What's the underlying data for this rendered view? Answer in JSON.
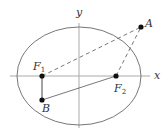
{
  "diagram": {
    "type": "ellipse-foci",
    "colors": {
      "ellipse": "#777777",
      "axis": "#aaaaaa",
      "line": "#555555",
      "point": "#111111",
      "label": "#333333"
    },
    "axes": {
      "x_label": "x",
      "y_label": "y"
    },
    "points": [
      {
        "id": "A",
        "label": "A"
      },
      {
        "id": "F1",
        "label": "F",
        "sub": "1"
      },
      {
        "id": "F2",
        "label": "F",
        "sub": "2"
      },
      {
        "id": "B",
        "label": "B"
      }
    ],
    "segments": [
      {
        "from": "F1",
        "to": "A",
        "style": "dashed"
      },
      {
        "from": "F2",
        "to": "A",
        "style": "dashed"
      },
      {
        "from": "F1",
        "to": "B",
        "style": "solid"
      },
      {
        "from": "B",
        "to": "F2",
        "style": "solid"
      }
    ]
  }
}
